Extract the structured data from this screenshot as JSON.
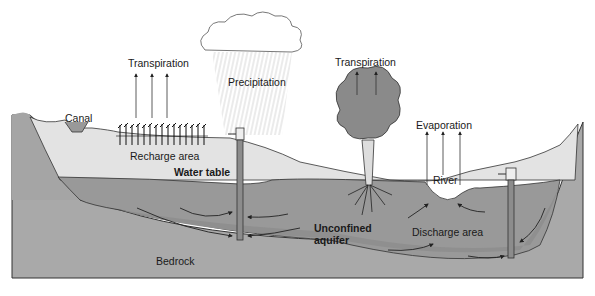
{
  "diagram": {
    "type": "groundwater cross-section",
    "labels": {
      "transpiration_left": "Transpiration",
      "precipitation": "Precipitation",
      "transpiration_right": "Transpiration",
      "canal": "Canal",
      "evaporation": "Evaporation",
      "recharge_area": "Recharge area",
      "water_table": "Water table",
      "river": "River",
      "unconfined_aquifer_line1": "Unconfined",
      "unconfined_aquifer_line2": "aquifer",
      "discharge_area": "Discharge area",
      "bedrock": "Bedrock"
    },
    "colors": {
      "bedrock": "#a9a9a9",
      "aquifer": "#9a9a9a",
      "unsaturated_soil": "#e3e3e3",
      "outline": "#333333",
      "well": "#8c8c8c",
      "tree_canopy": "#8a8a8a",
      "arrow": "#222222"
    }
  }
}
